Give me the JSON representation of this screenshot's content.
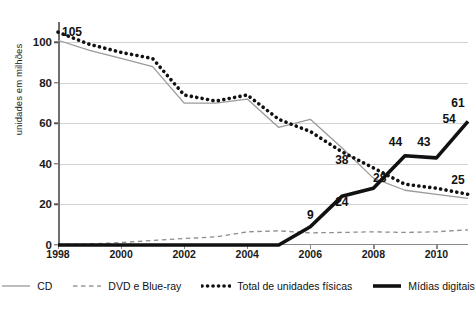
{
  "chart_data": {
    "type": "line",
    "title": "",
    "xlabel": "",
    "ylabel": "unidades em milhões",
    "x": [
      1998,
      1999,
      2000,
      2001,
      2002,
      2003,
      2004,
      2005,
      2006,
      2007,
      2008,
      2009,
      2010,
      2011
    ],
    "xtick_labels": [
      "1998",
      "2000",
      "2002",
      "2004",
      "2006",
      "2008",
      "2010"
    ],
    "xticks": [
      1998,
      2000,
      2002,
      2004,
      2006,
      2008,
      2010
    ],
    "ytick_labels": [
      "0",
      "20",
      "40",
      "60",
      "80",
      "100"
    ],
    "yticks": [
      0,
      20,
      40,
      60,
      80,
      100
    ],
    "ylim": [
      0,
      110
    ],
    "xlim": [
      1998,
      2011
    ],
    "grid": "horizontal",
    "legend_position": "bottom",
    "series": [
      {
        "name": "CD",
        "style": "thin-solid",
        "color": "#9a9a9a",
        "values": [
          101,
          96,
          92,
          88,
          70,
          70,
          72,
          58,
          62,
          48,
          33,
          27,
          25,
          23
        ]
      },
      {
        "name": "DVD e Blue-ray",
        "style": "dashed",
        "color": "#8d8d8d",
        "values": [
          0.3,
          0.5,
          1.2,
          2.2,
          3.2,
          4.0,
          6.5,
          7.0,
          6.0,
          6.2,
          6.5,
          6.2,
          6.5,
          7.5
        ]
      },
      {
        "name": "Total de unidades físicas",
        "style": "dotted",
        "color": "#111111",
        "values": [
          105,
          99,
          95,
          92,
          74,
          71,
          74,
          62,
          56,
          46,
          38,
          30,
          28,
          25
        ]
      },
      {
        "name": "Mídias digitais",
        "style": "thick-solid",
        "color": "#111111",
        "values": [
          0,
          0,
          0,
          0,
          0,
          0,
          0,
          0,
          9,
          24,
          28,
          44,
          43,
          61
        ]
      }
    ],
    "annotations": [
      {
        "label": "105",
        "x": 1998,
        "y": 105
      },
      {
        "label": "38",
        "x": 2007,
        "y": 42
      },
      {
        "label": "24",
        "x": 2007,
        "y": 21
      },
      {
        "label": "9",
        "x": 2006,
        "y": 15
      },
      {
        "label": "28",
        "x": 2008.2,
        "y": 33
      },
      {
        "label": "44",
        "x": 2008.7,
        "y": 51
      },
      {
        "label": "43",
        "x": 2009.6,
        "y": 51
      },
      {
        "label": "54",
        "x": 2010.4,
        "y": 62
      },
      {
        "label": "61",
        "x": 2011,
        "y": 70
      },
      {
        "label": "25",
        "x": 2011,
        "y": 32
      }
    ]
  },
  "legend": {
    "items": [
      {
        "label": "CD",
        "swatch": "thin-solid-swatch"
      },
      {
        "label": "DVD e Blue-ray",
        "swatch": "dashed-swatch"
      },
      {
        "label": "Total de unidades físicas",
        "swatch": "dotted-swatch"
      },
      {
        "label": "Mídias digitais",
        "swatch": "thick-solid-swatch"
      }
    ]
  },
  "colors": {
    "grid": "#d2d2d2",
    "axis": "#8a8a8a",
    "dark": "#111111",
    "gray": "#9a9a9a"
  }
}
